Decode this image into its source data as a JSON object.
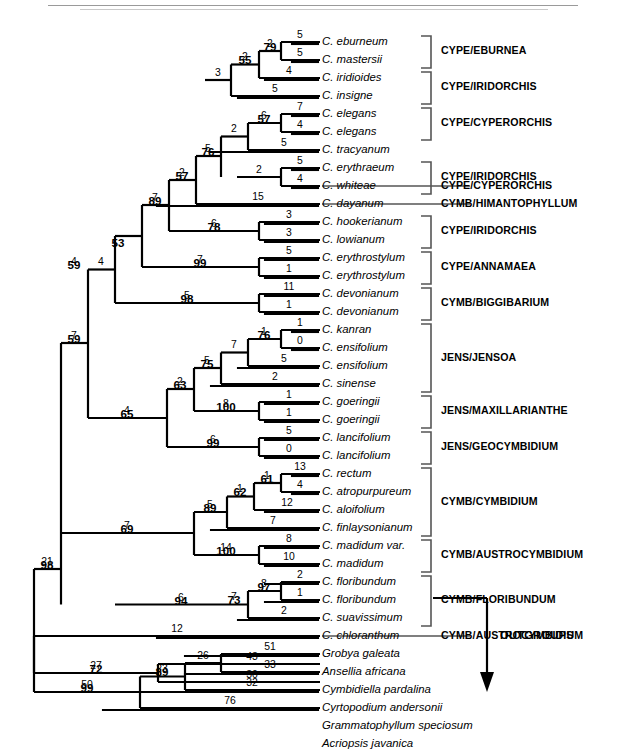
{
  "figure": {
    "type": "phylogenetic-tree",
    "style": "phylogram-with-branch-lengths-and-bootstrap",
    "outgroup_label": "OUTGROUPS"
  },
  "taxa": [
    {
      "i": 0,
      "name": "C. eburneum"
    },
    {
      "i": 1,
      "name": "C. mastersii"
    },
    {
      "i": 2,
      "name": "C. iridioides"
    },
    {
      "i": 3,
      "name": "C. insigne"
    },
    {
      "i": 4,
      "name": "C. elegans"
    },
    {
      "i": 5,
      "name": "C. elegans"
    },
    {
      "i": 6,
      "name": "C. tracyanum"
    },
    {
      "i": 7,
      "name": "C. erythraeum"
    },
    {
      "i": 8,
      "name": "C. whiteae"
    },
    {
      "i": 9,
      "name": "C. dayanum"
    },
    {
      "i": 10,
      "name": "C. hookerianum"
    },
    {
      "i": 11,
      "name": "C. lowianum"
    },
    {
      "i": 12,
      "name": "C. erythrostylum"
    },
    {
      "i": 13,
      "name": "C. erythrostylum"
    },
    {
      "i": 14,
      "name": "C. devonianum"
    },
    {
      "i": 15,
      "name": "C. devonianum"
    },
    {
      "i": 16,
      "name": "C. kanran"
    },
    {
      "i": 17,
      "name": "C. ensifolium"
    },
    {
      "i": 18,
      "name": "C. ensifolium"
    },
    {
      "i": 19,
      "name": "C. sinense"
    },
    {
      "i": 20,
      "name": "C. goeringii"
    },
    {
      "i": 21,
      "name": "C. goeringii"
    },
    {
      "i": 22,
      "name": "C. lancifolium"
    },
    {
      "i": 23,
      "name": "C. lancifolium"
    },
    {
      "i": 24,
      "name": "C. rectum"
    },
    {
      "i": 25,
      "name": "C. atropurpureum"
    },
    {
      "i": 26,
      "name": "C. aloifolium"
    },
    {
      "i": 27,
      "name": "C. finlaysonianum"
    },
    {
      "i": 28,
      "name": "C. madidum var."
    },
    {
      "i": 29,
      "name": "C. madidum"
    },
    {
      "i": 30,
      "name": "C. floribundum"
    },
    {
      "i": 31,
      "name": "C. floribundum"
    },
    {
      "i": 32,
      "name": "C. suavissimum"
    },
    {
      "i": 33,
      "name": "C. chloranthum"
    },
    {
      "i": 34,
      "name": "Grobya galeata"
    },
    {
      "i": 35,
      "name": "Ansellia africana"
    },
    {
      "i": 36,
      "name": "Cymbidiella pardalina"
    },
    {
      "i": 37,
      "name": "Cyrtopodium andersonii"
    },
    {
      "i": 38,
      "name": "Grammatophyllum speciosum"
    },
    {
      "i": 39,
      "name": "Acriopsis javanica"
    }
  ],
  "clade_labels": [
    {
      "id": "cl0",
      "text": "CYPE/EBURNEA"
    },
    {
      "id": "cl1",
      "text": "CYPE/IRIDORCHIS"
    },
    {
      "id": "cl2",
      "text": "CYPE/CYPERORCHIS"
    },
    {
      "id": "cl3",
      "text": "CYPE/IRIDORCHIS"
    },
    {
      "id": "cl4",
      "text": "CYPE/CYPERORCHIS"
    },
    {
      "id": "cl5",
      "text": "CYMB/HIMANTOPHYLLUM"
    },
    {
      "id": "cl6",
      "text": "CYPE/IRIDORCHIS"
    },
    {
      "id": "cl7",
      "text": "CYPE/ANNAMAEA"
    },
    {
      "id": "cl8",
      "text": "CYMB/BIGGIBARIUM"
    },
    {
      "id": "cl9",
      "text": "JENS/JENSOA"
    },
    {
      "id": "cl10",
      "text": "JENS/MAXILLARIANTHE"
    },
    {
      "id": "cl11",
      "text": "JENS/GEOCYMBIDIUM"
    },
    {
      "id": "cl12",
      "text": "CYMB/CYMBIDIUM"
    },
    {
      "id": "cl13",
      "text": "CYMB/AUSTROCYMBIDIUM"
    },
    {
      "id": "cl14",
      "text": "CYMB/FLORIBUNDUM"
    },
    {
      "id": "cl15",
      "text": "CYMB/AUSTROCYMBIDIUM"
    }
  ],
  "branch_lengths": [
    {
      "id": "bl_t0",
      "v": "5"
    },
    {
      "id": "bl_t1",
      "v": "5"
    },
    {
      "id": "bl_n_eburnea",
      "v": "2"
    },
    {
      "id": "bl_t2",
      "v": "4"
    },
    {
      "id": "bl_n55",
      "v": "2"
    },
    {
      "id": "bl_t3",
      "v": "5"
    },
    {
      "id": "bl_n53top",
      "v": "3"
    },
    {
      "id": "bl_t4",
      "v": "7"
    },
    {
      "id": "bl_t5",
      "v": "4"
    },
    {
      "id": "bl_n57cyp",
      "v": "6"
    },
    {
      "id": "bl_t6",
      "v": "5"
    },
    {
      "id": "bl_n2a",
      "v": "2"
    },
    {
      "id": "bl_t7",
      "v": "5"
    },
    {
      "id": "bl_t8",
      "v": "4"
    },
    {
      "id": "bl_n_eryth",
      "v": "2"
    },
    {
      "id": "bl_n76",
      "v": "5"
    },
    {
      "id": "bl_n57b",
      "v": "2"
    },
    {
      "id": "bl_t9",
      "v": "15"
    },
    {
      "id": "bl_t10",
      "v": "3"
    },
    {
      "id": "bl_t11",
      "v": "3"
    },
    {
      "id": "bl_n78",
      "v": "6"
    },
    {
      "id": "bl_n89",
      "v": "7"
    },
    {
      "id": "bl_n4top",
      "v": "4"
    },
    {
      "id": "bl_t12",
      "v": "5"
    },
    {
      "id": "bl_t13",
      "v": "1"
    },
    {
      "id": "bl_n99",
      "v": "7"
    },
    {
      "id": "bl_t14",
      "v": "11"
    },
    {
      "id": "bl_t15",
      "v": "1"
    },
    {
      "id": "bl_n98big",
      "v": "5"
    },
    {
      "id": "bl_t16",
      "v": "1"
    },
    {
      "id": "bl_t17",
      "v": "0"
    },
    {
      "id": "bl_n76j",
      "v": "1"
    },
    {
      "id": "bl_t18",
      "v": "5"
    },
    {
      "id": "bl_n7j",
      "v": "7"
    },
    {
      "id": "bl_t19",
      "v": "2"
    },
    {
      "id": "bl_n75",
      "v": "5"
    },
    {
      "id": "bl_t20",
      "v": "1"
    },
    {
      "id": "bl_t21",
      "v": "1"
    },
    {
      "id": "bl_n100max",
      "v": "8"
    },
    {
      "id": "bl_n63",
      "v": "2"
    },
    {
      "id": "bl_t22",
      "v": "5"
    },
    {
      "id": "bl_t23",
      "v": "0"
    },
    {
      "id": "bl_n99geo",
      "v": "6"
    },
    {
      "id": "bl_n65",
      "v": "4"
    },
    {
      "id": "bl_n59",
      "v": "4"
    },
    {
      "id": "bl_n59b",
      "v": "7"
    },
    {
      "id": "bl_t24",
      "v": "13"
    },
    {
      "id": "bl_t25",
      "v": "4"
    },
    {
      "id": "bl_n61",
      "v": "1"
    },
    {
      "id": "bl_t26",
      "v": "12"
    },
    {
      "id": "bl_n62",
      "v": "1"
    },
    {
      "id": "bl_t27",
      "v": "7"
    },
    {
      "id": "bl_n89c",
      "v": "5"
    },
    {
      "id": "bl_t28",
      "v": "8"
    },
    {
      "id": "bl_t29",
      "v": "10"
    },
    {
      "id": "bl_n100aus",
      "v": "14"
    },
    {
      "id": "bl_n69",
      "v": "7"
    },
    {
      "id": "bl_t30",
      "v": "2"
    },
    {
      "id": "bl_t31",
      "v": "1"
    },
    {
      "id": "bl_n97",
      "v": "8"
    },
    {
      "id": "bl_t32",
      "v": "2"
    },
    {
      "id": "bl_n73",
      "v": "7"
    },
    {
      "id": "bl_n94",
      "v": "6"
    },
    {
      "id": "bl_t33",
      "v": "12"
    },
    {
      "id": "bl_n98root",
      "v": "21"
    },
    {
      "id": "bl_t34",
      "v": "51"
    },
    {
      "id": "bl_t35",
      "v": "33"
    },
    {
      "id": "bl_n26",
      "v": "26"
    },
    {
      "id": "bl_t36",
      "v": "32"
    },
    {
      "id": "bl_n89o",
      "v": "23"
    },
    {
      "id": "bl_t37",
      "v": "76"
    },
    {
      "id": "bl_n99o",
      "v": "50"
    },
    {
      "id": "bl_t38",
      "v": "43"
    },
    {
      "id": "bl_t39",
      "v": "30"
    },
    {
      "id": "bl_n72",
      "v": "27"
    }
  ],
  "bootstrap_values": [
    {
      "id": "bs_79",
      "v": "79"
    },
    {
      "id": "bs_55",
      "v": "55"
    },
    {
      "id": "bs_57cyp",
      "v": "57"
    },
    {
      "id": "bs_76",
      "v": "76"
    },
    {
      "id": "bs_57b",
      "v": "57"
    },
    {
      "id": "bs_78",
      "v": "78"
    },
    {
      "id": "bs_89",
      "v": "89"
    },
    {
      "id": "bs_53",
      "v": "53"
    },
    {
      "id": "bs_99",
      "v": "99"
    },
    {
      "id": "bs_98big",
      "v": "98"
    },
    {
      "id": "bs_76j",
      "v": "76"
    },
    {
      "id": "bs_75",
      "v": "75"
    },
    {
      "id": "bs_100max",
      "v": "100"
    },
    {
      "id": "bs_63",
      "v": "63"
    },
    {
      "id": "bs_99geo",
      "v": "99"
    },
    {
      "id": "bs_65",
      "v": "65"
    },
    {
      "id": "bs_59",
      "v": "59"
    },
    {
      "id": "bs_59b",
      "v": "59"
    },
    {
      "id": "bs_61",
      "v": "61"
    },
    {
      "id": "bs_62",
      "v": "62"
    },
    {
      "id": "bs_89c",
      "v": "89"
    },
    {
      "id": "bs_100aus",
      "v": "100"
    },
    {
      "id": "bs_69",
      "v": "69"
    },
    {
      "id": "bs_97",
      "v": "97"
    },
    {
      "id": "bs_73",
      "v": "73"
    },
    {
      "id": "bs_94",
      "v": "94"
    },
    {
      "id": "bs_98root",
      "v": "98"
    },
    {
      "id": "bs_89o",
      "v": "89"
    },
    {
      "id": "bs_99o",
      "v": "99"
    },
    {
      "id": "bs_72",
      "v": "72"
    }
  ]
}
